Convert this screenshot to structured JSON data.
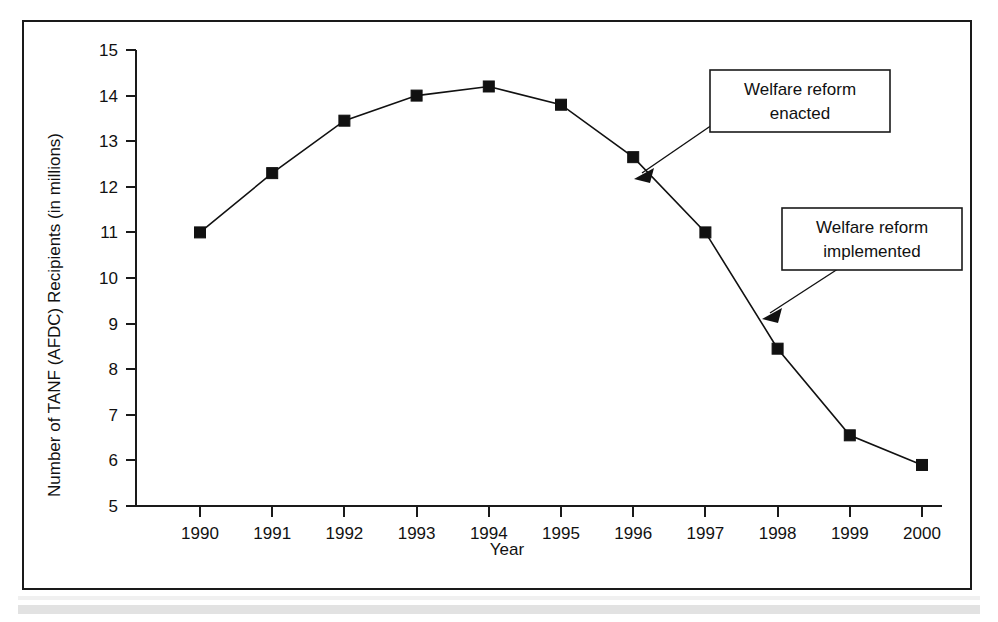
{
  "figure": {
    "frame_color": "#1a1a1a",
    "background": "#ffffff",
    "line_color": "#111111"
  },
  "chart_data": {
    "type": "line",
    "title": "",
    "xlabel": "Year",
    "ylabel": "Number of TANF (AFDC) Recipients (in millions)",
    "categories": [
      "1990",
      "1991",
      "1992",
      "1993",
      "1994",
      "1995",
      "1996",
      "1997",
      "1998",
      "1999",
      "2000"
    ],
    "x": [
      1990,
      1991,
      1992,
      1993,
      1994,
      1995,
      1996,
      1997,
      1998,
      1999,
      2000
    ],
    "values": [
      11.0,
      12.3,
      13.45,
      14.0,
      14.2,
      13.8,
      12.65,
      11.0,
      8.45,
      6.55,
      5.9
    ],
    "ylim": [
      5,
      15
    ],
    "xlim": [
      1990,
      2000
    ],
    "ytick_labels": [
      "15",
      "14",
      "13",
      "12",
      "11",
      "10",
      "9",
      "8",
      "7",
      "6",
      "5"
    ],
    "yticks": [
      15,
      14,
      13,
      12,
      11,
      10,
      9,
      8,
      7,
      6,
      5
    ],
    "xtick_labels": [
      "1990",
      "1991",
      "1992",
      "1993",
      "1994",
      "1995",
      "1996",
      "1997",
      "1998",
      "1999",
      "2000"
    ],
    "grid": false,
    "legend": false,
    "marker": "square",
    "annotations": [
      {
        "id": "welfare-reform-enacted",
        "line1": "Welfare reform",
        "line2": "enacted",
        "points_to_year": 1996,
        "points_to_value": 12.0
      },
      {
        "id": "welfare-reform-implemented",
        "line1": "Welfare reform",
        "line2": "implemented",
        "points_to_year": 1997,
        "points_to_value": 9.7
      }
    ]
  }
}
